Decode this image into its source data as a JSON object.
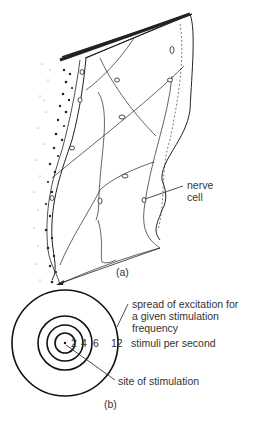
{
  "figure_a": {
    "caption": "(a)",
    "label_nerve_cell_line1": "nerve",
    "label_nerve_cell_line2": "cell"
  },
  "figure_b": {
    "caption": "(b)",
    "spread_label_line1": "spread of excitation for",
    "spread_label_line2": "a given stimulation",
    "spread_label_line3": "frequency",
    "ring_values": [
      "2",
      "4",
      "6",
      "12"
    ],
    "ring_unit_label": "stimuli per second",
    "center_label": "site of stimulation"
  },
  "colors": {
    "ink": "#222222",
    "background": "#ffffff"
  }
}
